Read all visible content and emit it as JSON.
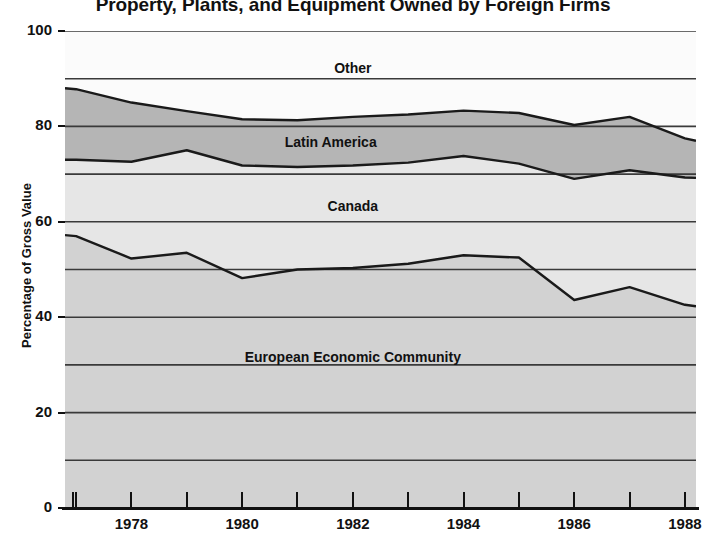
{
  "title": "Property, Plants, and Equipment Owned by Foreign Firms",
  "axes": {
    "ylabel": "Percentage of Gross Value",
    "yticks": [
      "0",
      "20",
      "40",
      "60",
      "80",
      "100"
    ],
    "xticks": [
      "1978",
      "1980",
      "1982",
      "1984",
      "1986",
      "1988"
    ]
  },
  "area_labels": {
    "other": "Other",
    "latin_america": "Latin America",
    "canada": "Canada",
    "eec": "European  Economic  Community"
  },
  "colors": {
    "eec_fill": "#d2d2d2",
    "canada_fill": "#e6e6e6",
    "latin_fill": "#b5b5b5",
    "other_fill": "#fbfbfb",
    "line": "#1a1a1a",
    "gridline": "#3a3a3a",
    "text": "#111111"
  },
  "chart_data": {
    "type": "area",
    "title": "Property, Plants, and Equipment Owned by Foreign Firms",
    "xlabel": "",
    "ylabel": "Percentage of Gross Value",
    "ylim": [
      0,
      100
    ],
    "xlim": [
      1976.8,
      1988.2
    ],
    "stacked": true,
    "grid": true,
    "gridline_interval": 10,
    "legend_position": "inline-area-labels",
    "x": [
      1976.8,
      1977,
      1978,
      1979,
      1980,
      1981,
      1982,
      1983,
      1984,
      1985,
      1986,
      1987,
      1988,
      1988.2
    ],
    "cumulative_series": [
      {
        "name": "European Economic Community",
        "description": "top boundary of EEC band (cumulative share)",
        "values": [
          57.2,
          57.0,
          52.3,
          53.5,
          48.2,
          50.0,
          50.3,
          51.2,
          53.0,
          52.5,
          43.6,
          46.3,
          42.6,
          42.3
        ]
      },
      {
        "name": "Canada",
        "description": "top boundary of Canada band (EEC + Canada)",
        "values": [
          73.0,
          73.0,
          72.6,
          75.0,
          71.8,
          71.5,
          71.8,
          72.4,
          73.8,
          72.2,
          69.0,
          70.8,
          69.3,
          69.2
        ]
      },
      {
        "name": "Latin America",
        "description": "top boundary of Latin America band (EEC + Canada + Latin America)",
        "values": [
          88.0,
          87.8,
          85.0,
          83.2,
          81.5,
          81.3,
          82.0,
          82.5,
          83.3,
          82.8,
          80.3,
          82.0,
          77.5,
          77.0
        ]
      },
      {
        "name": "Other",
        "description": "top boundary at 100 percent",
        "values": [
          100,
          100,
          100,
          100,
          100,
          100,
          100,
          100,
          100,
          100,
          100,
          100,
          100,
          100
        ]
      }
    ],
    "band_values": {
      "European Economic Community": [
        57.2,
        57.0,
        52.3,
        53.5,
        48.2,
        50.0,
        50.3,
        51.2,
        53.0,
        52.5,
        43.6,
        46.3,
        42.6,
        42.3
      ],
      "Canada": [
        15.8,
        16.0,
        20.3,
        21.5,
        23.6,
        21.5,
        21.5,
        21.2,
        20.8,
        19.7,
        25.4,
        24.5,
        26.7,
        26.9
      ],
      "Latin America": [
        15.0,
        14.8,
        12.4,
        8.2,
        9.7,
        9.8,
        10.2,
        10.1,
        9.5,
        10.6,
        11.3,
        11.2,
        8.2,
        7.8
      ],
      "Other": [
        12.0,
        12.2,
        15.0,
        16.8,
        18.5,
        18.7,
        18.0,
        17.5,
        16.7,
        17.2,
        19.7,
        18.0,
        22.5,
        23.0
      ]
    }
  }
}
